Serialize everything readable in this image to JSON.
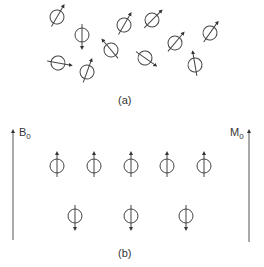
{
  "panel_a": {
    "caption": "(a)",
    "description": "Randomly oriented nuclear spins in absence of field",
    "spins": [
      {
        "x": 57,
        "y": 17,
        "angle": 30
      },
      {
        "x": 82,
        "y": 35,
        "angle": 180
      },
      {
        "x": 124,
        "y": 25,
        "angle": 30
      },
      {
        "x": 152,
        "y": 20,
        "angle": 45
      },
      {
        "x": 111,
        "y": 50,
        "angle": -40
      },
      {
        "x": 145,
        "y": 58,
        "angle": 125
      },
      {
        "x": 175,
        "y": 43,
        "angle": 40
      },
      {
        "x": 210,
        "y": 33,
        "angle": 35
      },
      {
        "x": 58,
        "y": 63,
        "angle": 100
      },
      {
        "x": 87,
        "y": 72,
        "angle": 20
      },
      {
        "x": 195,
        "y": 65,
        "angle": -10
      }
    ]
  },
  "panel_b": {
    "caption": "(b)",
    "field_label": "B",
    "field_sub": "0",
    "magnetization_label": "M",
    "magnetization_sub": "0",
    "spins_up": [
      {
        "x": 57,
        "y": 166
      },
      {
        "x": 94,
        "y": 166
      },
      {
        "x": 131,
        "y": 166
      },
      {
        "x": 167,
        "y": 166
      },
      {
        "x": 204,
        "y": 166
      }
    ],
    "spins_down": [
      {
        "x": 75,
        "y": 216
      },
      {
        "x": 131,
        "y": 216
      },
      {
        "x": 186,
        "y": 216
      }
    ]
  },
  "colors": {
    "stroke": "#444444",
    "text": "#333333"
  }
}
